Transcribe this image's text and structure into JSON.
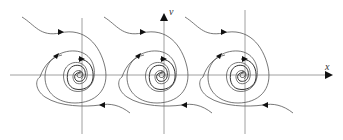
{
  "figure": {
    "type": "phase-portrait",
    "axes": {
      "x_label": "x",
      "y_label": "v"
    },
    "spiral_centers": [
      {
        "x": 80,
        "y": 75
      },
      {
        "x": 162,
        "y": 75
      },
      {
        "x": 243,
        "y": 75
      }
    ],
    "colors": {
      "line": "#555555",
      "axis": "#888888",
      "arrow": "#111111"
    }
  }
}
